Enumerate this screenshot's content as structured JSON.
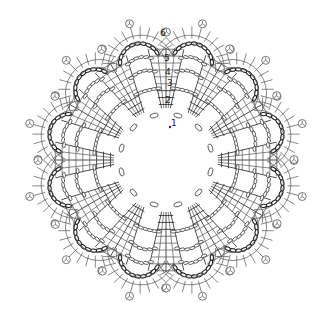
{
  "diagram": {
    "type": "crochet-doily-chart",
    "width": 332,
    "height": 318,
    "center": [
      166,
      160
    ],
    "colors": {
      "background": "#ffffff",
      "line": "#555555",
      "dark_line": "#222222",
      "text": "#222222"
    },
    "center_ring": {
      "chain_loops": 12,
      "radius": 46
    },
    "spokes": {
      "count": 12,
      "start_angle_deg": 0,
      "inner_radius": 52,
      "outer_radius": 112,
      "stitch_rows": 9
    },
    "lobes": {
      "count": 12,
      "start_angle_deg": 15,
      "center_radius": 118,
      "arch_radius": 30,
      "outer_radius": 40,
      "picots_per_lobe": 3
    },
    "inner_arches": {
      "rows": 3,
      "radii": [
        72,
        88,
        102
      ]
    },
    "round_labels": [
      {
        "text": "1",
        "x": 171,
        "y": 126
      },
      {
        "text": "2",
        "x": 165,
        "y": 103
      },
      {
        "text": "3",
        "x": 167,
        "y": 86
      },
      {
        "text": "4",
        "x": 165,
        "y": 75
      },
      {
        "text": "5",
        "x": 164,
        "y": 61
      },
      {
        "text": "6",
        "x": 160,
        "y": 36
      }
    ]
  }
}
